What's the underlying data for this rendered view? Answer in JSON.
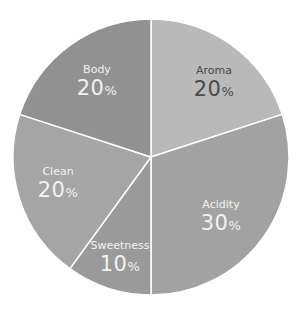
{
  "chart_data": {
    "type": "pie",
    "title": "",
    "categories": [
      "Aroma",
      "Acidity",
      "Sweetness",
      "Clean",
      "Body"
    ],
    "values": [
      20,
      30,
      10,
      20,
      20
    ],
    "unit": "%",
    "start_angle_deg": 0,
    "direction": "clockwise",
    "colors": [
      "#b9b9b9",
      "#a2a2a2",
      "#9a9a9a",
      "#a5a5a5",
      "#919191"
    ],
    "label_colors": [
      "#4a4a4a",
      "#f2f2f2",
      "#f2f2f2",
      "#f2f2f2",
      "#f2f2f2"
    ],
    "legend": "none",
    "slice_border_color": "#ffffff"
  },
  "labels": [
    {
      "name": "Aroma",
      "value": "20",
      "pct": "%"
    },
    {
      "name": "Acidity",
      "value": "30",
      "pct": "%"
    },
    {
      "name": "Sweetness",
      "value": "10",
      "pct": "%"
    },
    {
      "name": "Clean",
      "value": "20",
      "pct": "%"
    },
    {
      "name": "Body",
      "value": "20",
      "pct": "%"
    }
  ]
}
